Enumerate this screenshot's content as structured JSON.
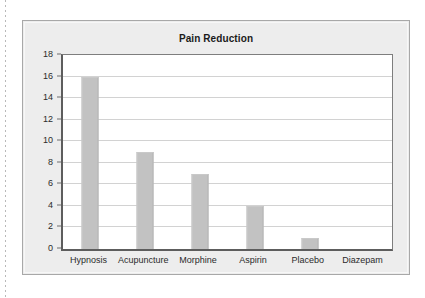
{
  "chart_data": {
    "type": "bar",
    "title": "Pain Reduction",
    "xlabel": "",
    "ylabel": "",
    "categories": [
      "Hypnosis",
      "Acupuncture",
      "Morphine",
      "Aspirin",
      "Placebo",
      "Diazepam"
    ],
    "values": [
      16,
      9,
      7,
      4,
      1,
      0
    ],
    "ylim": [
      0,
      18
    ],
    "ytick_step": 2,
    "yticks": [
      0,
      2,
      4,
      6,
      8,
      10,
      12,
      14,
      16,
      18
    ],
    "ytick_labels": [
      "0",
      "2",
      "4",
      "6",
      "8",
      "10",
      "12",
      "14",
      "16",
      "18"
    ],
    "grid": true,
    "grid_axis": "y",
    "legend": false,
    "legend_position": "none",
    "bar_color": "#c2c2c2",
    "plot_background": "#ffffff",
    "panel_background": "#ededed",
    "axis_color": "#5d5d5d",
    "gridline_color": "#d2d2d2",
    "title_color": "#1b1b1b",
    "tick_label_color": "#2b2b2b"
  }
}
